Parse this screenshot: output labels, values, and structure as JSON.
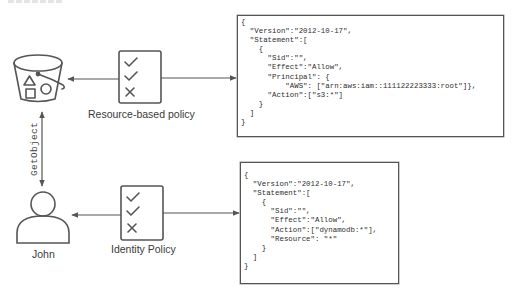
{
  "diagram": {
    "type": "aws-iam-policy-evaluation",
    "colors": {
      "stroke": "#555555",
      "text": "#3a3a3a",
      "background": "#ffffff"
    },
    "nodes": {
      "bucket": {
        "icon": "s3-bucket-icon"
      },
      "user": {
        "icon": "user-icon",
        "label": "John"
      },
      "resource_policy": {
        "icon": "checklist-icon",
        "label": "Resource-based policy"
      },
      "identity_policy": {
        "icon": "checklist-icon",
        "label": "Identity Policy"
      }
    },
    "edges": [
      {
        "from": "user",
        "to": "bucket",
        "label": "GetObject",
        "direction": "both"
      },
      {
        "from": "resource_policy",
        "to": "bucket",
        "direction": "one-way"
      },
      {
        "from": "resource_policy",
        "to": "resource_policy_document",
        "direction": "one-way"
      },
      {
        "from": "identity_policy",
        "to": "user",
        "direction": "one-way"
      },
      {
        "from": "identity_policy",
        "to": "identity_policy_document",
        "direction": "one-way"
      }
    ]
  },
  "resource_policy_document": {
    "lines": [
      "{",
      "  \"Version\":\"2012-10-17\",",
      "  \"Statement\":[",
      "    {",
      "      \"Sid\":\"\",",
      "      \"Effect\":\"Allow\",",
      "      \"Principal\": {",
      "          \"AWS\": [\"arn:aws:iam::111122223333:root\"]},",
      "      \"Action\":[\"s3:*\"]",
      "    }",
      "  ]",
      "}"
    ]
  },
  "identity_policy_document": {
    "lines": [
      "{",
      "  \"Version\":\"2012-10-17\",",
      "  \"Statement\":[",
      "    {",
      "      \"Sid\":\"\",",
      "      \"Effect\":\"Allow\",",
      "      \"Action\":[\"dynamodb:*\"],",
      "      \"Resource\": \"*\"",
      "    }",
      "  ]",
      "}"
    ]
  }
}
